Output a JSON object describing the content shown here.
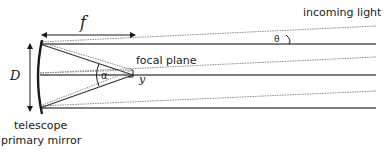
{
  "labels": {
    "focal_length": "f",
    "diameter": "D",
    "incoming_light": "incoming light",
    "theta": "θ",
    "focal_plane": "focal plane",
    "alpha": "α",
    "y": "y",
    "mirror_line1": "telescope",
    "mirror_line2": "primary mirror"
  },
  "colors": {
    "solid_ray": "#555555",
    "dotted_ray": "#8a8a8a",
    "ink": "#1a1a1a"
  }
}
